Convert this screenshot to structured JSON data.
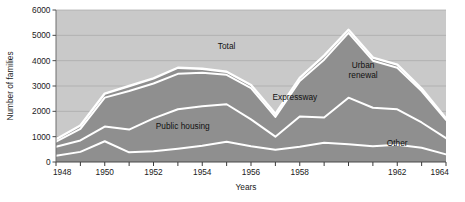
{
  "chart_data": {
    "type": "area",
    "stacked": true,
    "title": "",
    "xlabel": "Years",
    "ylabel": "Number of families",
    "x": [
      1948,
      1949,
      1950,
      1951,
      1952,
      1953,
      1954,
      1955,
      1956,
      1957,
      1958,
      1959,
      1960,
      1961,
      1962,
      1963,
      1964
    ],
    "xlim": [
      1948,
      1964
    ],
    "ylim": [
      0,
      6000
    ],
    "xticklabels": [
      "1948",
      "1950",
      "1952",
      "1954",
      "1956",
      "1958",
      "1962",
      "1964"
    ],
    "xticks": [
      1948,
      1950,
      1952,
      1954,
      1956,
      1958,
      1962,
      1964
    ],
    "yticks": [
      0,
      1000,
      2000,
      3000,
      4000,
      5000,
      6000
    ],
    "yticklabels": [
      "0",
      "1000",
      "2000",
      "3000",
      "4000",
      "5000",
      "6000"
    ],
    "grid": true,
    "grid_axis": "y",
    "legend": "inline-annotations",
    "series": [
      {
        "name": "Public housing",
        "order": 1,
        "values": [
          250,
          400,
          820,
          380,
          420,
          520,
          640,
          800,
          620,
          480,
          600,
          760,
          700,
          620,
          680,
          560,
          300
        ]
      },
      {
        "name": "Expressway",
        "order": 2,
        "values": [
          350,
          450,
          580,
          900,
          1300,
          1560,
          1560,
          1480,
          1060,
          520,
          1200,
          1000,
          1840,
          1520,
          1400,
          1000,
          640
        ]
      },
      {
        "name": "Urban renewal",
        "order": 3,
        "values": [
          200,
          460,
          1140,
          1520,
          1380,
          1400,
          1320,
          1160,
          1240,
          780,
          1400,
          2280,
          2560,
          1860,
          1640,
          1240,
          720
        ]
      },
      {
        "name": "Other",
        "order": 4,
        "values": [
          100,
          130,
          160,
          200,
          200,
          240,
          160,
          120,
          120,
          120,
          120,
          160,
          120,
          120,
          120,
          100,
          60
        ]
      }
    ],
    "total": {
      "name": "Total",
      "values": [
        900,
        1440,
        2700,
        3000,
        3300,
        3720,
        3680,
        3560,
        3040,
        1900,
        3320,
        4200,
        5220,
        4120,
        3840,
        2900,
        1720
      ]
    },
    "annotations": [
      {
        "text": "Total",
        "x": 1955,
        "y": 4450
      },
      {
        "text": "Urban renewal",
        "x": 1960.6,
        "y": 3700
      },
      {
        "text": "Expressway",
        "x": 1957.8,
        "y": 2450
      },
      {
        "text": "Public housing",
        "x": 1953.2,
        "y": 1300
      },
      {
        "text": "Other",
        "x": 1962.0,
        "y": 620
      }
    ],
    "colors": {
      "plot_background": "#c9c9c9",
      "band_fill": "#8f8f8f",
      "band_separator": "#ffffff",
      "gridline": "#a8a8a8",
      "axis_line": "#6e6e6e",
      "text": "#1a1a1a",
      "page_background": "#ffffff"
    }
  }
}
